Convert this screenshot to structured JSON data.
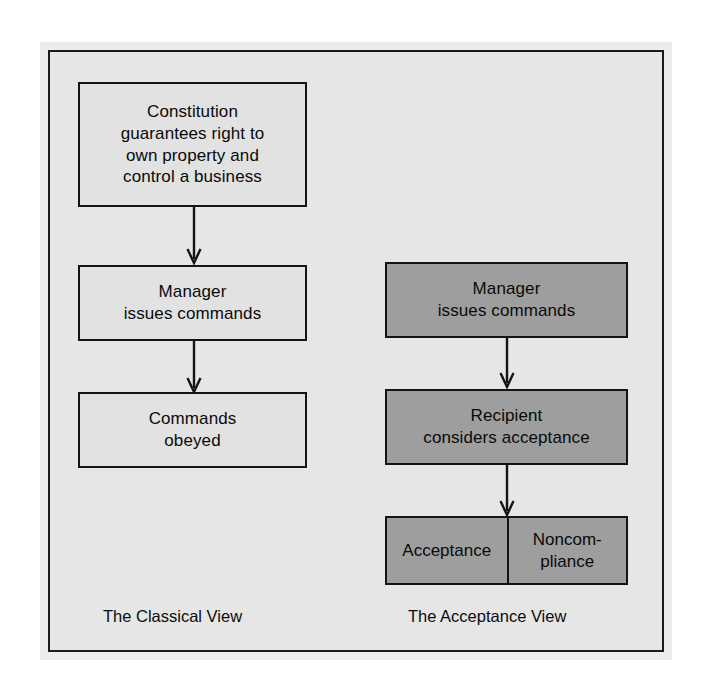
{
  "figure": {
    "background_color": "#e6e6e6",
    "frame_border_color": "#1a1a1a",
    "light_box_color": "#e2e2e2",
    "shaded_box_color": "#9e9e9e",
    "arrow_color": "#141414"
  },
  "classical_view": {
    "caption": "The Classical View",
    "boxes": [
      {
        "text": "Constitution\nguarantees right to\nown property and\ncontrol a business",
        "shade": "light"
      },
      {
        "text": "Manager\nissues commands",
        "shade": "light"
      },
      {
        "text": "Commands\nobeyed",
        "shade": "light"
      }
    ],
    "arrows": [
      {
        "from": "Constitution guarantees right to own property and control a business",
        "to": "Manager issues commands"
      },
      {
        "from": "Manager issues commands",
        "to": "Commands obeyed"
      }
    ]
  },
  "acceptance_view": {
    "caption": "The Acceptance View",
    "boxes": [
      {
        "text": "Manager\nissues commands",
        "shade": "shaded"
      },
      {
        "text": "Recipient\nconsiders acceptance",
        "shade": "shaded"
      }
    ],
    "outcome_box": {
      "shade": "shaded",
      "left_label": "Acceptance",
      "right_label": "Noncom-\npliance"
    },
    "arrows": [
      {
        "from": "Manager issues commands",
        "to": "Recipient considers acceptance"
      },
      {
        "from": "Recipient considers acceptance",
        "to": "Acceptance / Noncompliance"
      }
    ]
  }
}
